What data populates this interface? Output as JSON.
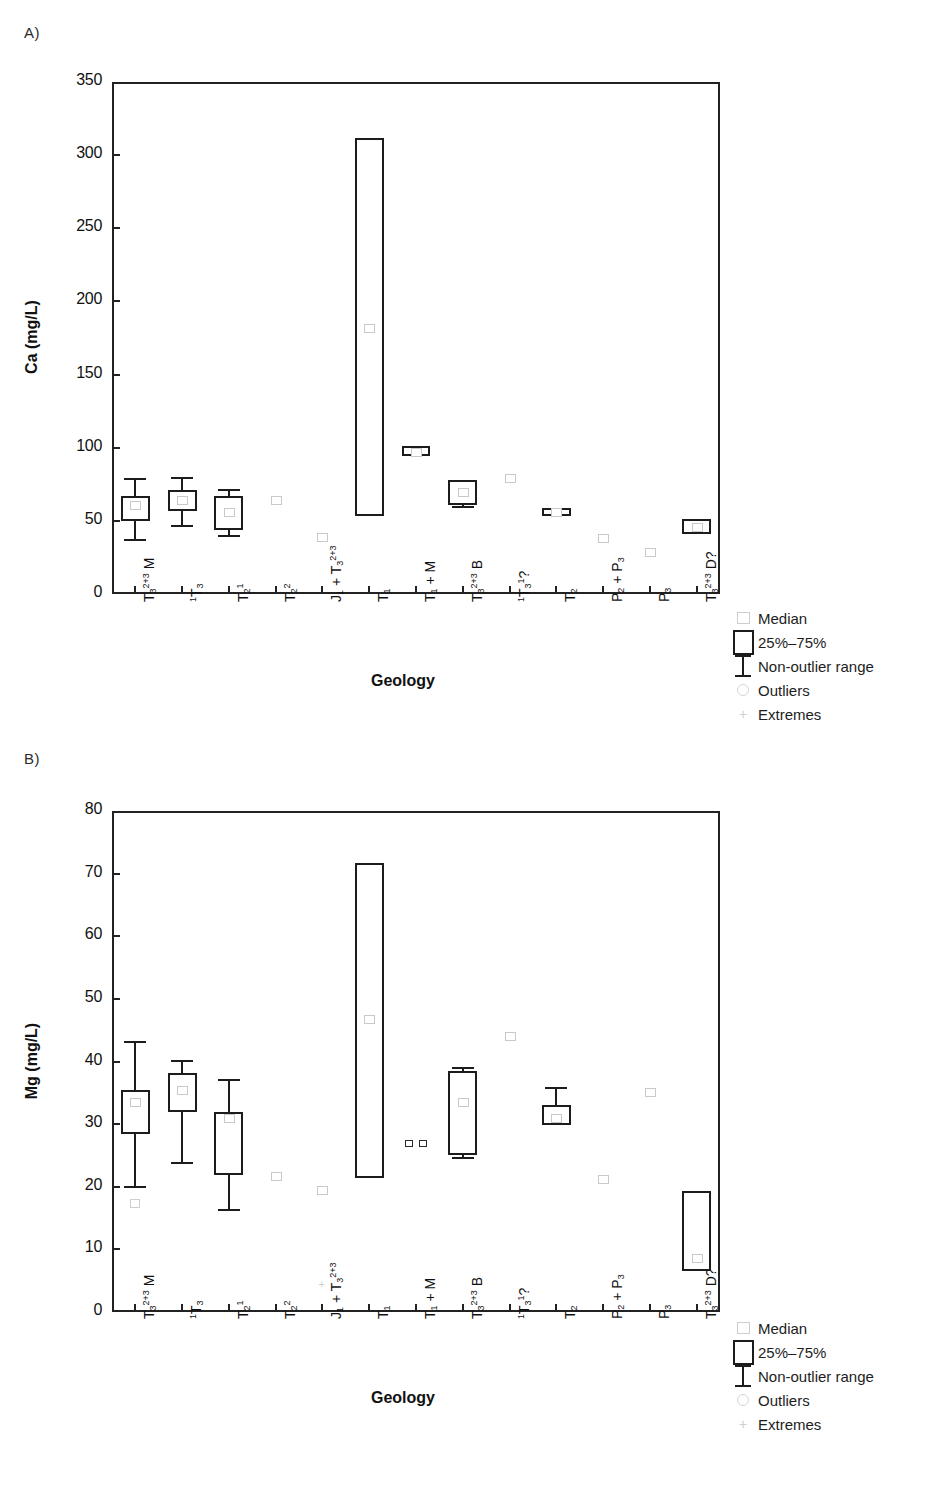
{
  "figure": {
    "panel_a_letter": "A)",
    "panel_b_letter": "B)"
  },
  "legend": {
    "items": [
      {
        "label": "Median",
        "symbol": "median-square-icon"
      },
      {
        "label": "25%–75%",
        "symbol": "box-icon"
      },
      {
        "label": "Non-outlier range",
        "symbol": "whisker-icon"
      },
      {
        "label": "Outliers",
        "symbol": "outlier-circle-icon"
      },
      {
        "label": "Extremes",
        "symbol": "extreme-cross-icon"
      }
    ]
  },
  "chart_data": [
    {
      "type": "box",
      "panel": "A",
      "title": "",
      "xlabel": "Geology",
      "ylabel": "Ca (mg/L)",
      "ylim": [
        0,
        350
      ],
      "yticks": [
        0,
        50,
        100,
        150,
        200,
        250,
        300,
        350
      ],
      "ytick_labels": [
        "0",
        "50",
        "100",
        "150",
        "200",
        "250",
        "300",
        "350"
      ],
      "grid": false,
      "categories": [
        {
          "html": "T<sub>3</sub><sup>2+3</sup> M",
          "plain": "T3^2+3 M"
        },
        {
          "html": "<span class=\"pre\">1</span>T<sub>3</sub>",
          "plain": "1T3"
        },
        {
          "html": "T<sub>2</sub><sup>1</sup>",
          "plain": "T2^1"
        },
        {
          "html": "T<sub>2</sub><sup>2</sup>",
          "plain": "T2^2"
        },
        {
          "html": "J<sub>1</sub> + T<sub>3</sub><sup>2+3</sup>",
          "plain": "J1 + T3^2+3"
        },
        {
          "html": "T<sub>1</sub>",
          "plain": "T1"
        },
        {
          "html": "T<sub>1</sub> + M",
          "plain": "T1 + M"
        },
        {
          "html": "T<sub>3</sub><sup>2+3</sup> B",
          "plain": "T3^2+3 B"
        },
        {
          "html": "<span class=\"pre\">1</span>T<sub>3</sub><sup>1</sup>?",
          "plain": "1T3^1 ?"
        },
        {
          "html": "T<sub>2</sub>",
          "plain": "T2"
        },
        {
          "html": "P<sub>2</sub> + P<sub>3</sub>",
          "plain": "P2 + P3"
        },
        {
          "html": "P<sub>3</sub>",
          "plain": "P3"
        },
        {
          "html": "T<sub>3</sub><sup>2+3</sup> D?",
          "plain": "T3^2+3 D?"
        }
      ],
      "boxes": [
        {
          "category": "T3^2+3 M",
          "q1": 50,
          "q3": 67,
          "median": 61,
          "whisker_low": 36,
          "whisker_high": 79,
          "has_box": true
        },
        {
          "category": "1T3",
          "q1": 57,
          "q3": 71,
          "median": 64,
          "whisker_low": 46,
          "whisker_high": 80,
          "has_box": true
        },
        {
          "category": "T2^1",
          "q1": 44,
          "q3": 67,
          "median": 56,
          "whisker_low": 39,
          "whisker_high": 72,
          "has_box": true
        },
        {
          "category": "T2^2",
          "median": 64,
          "has_box": false
        },
        {
          "category": "J1 + T3^2+3",
          "median": 39,
          "has_box": false
        },
        {
          "category": "T1",
          "q1": 53,
          "q3": 312,
          "median": 182,
          "has_box": true
        },
        {
          "category": "T1 + M",
          "q1": 94,
          "q3": 101,
          "median": 97,
          "has_box": true
        },
        {
          "category": "T3^2+3 B",
          "q1": 61,
          "q3": 78,
          "median": 70,
          "whisker_low": 59,
          "has_box": true
        },
        {
          "category": "1T3^1 ?",
          "median": 79,
          "has_box": false
        },
        {
          "category": "T2",
          "q1": 53,
          "q3": 59,
          "median": 56,
          "whisker_high": 59,
          "has_box": true
        },
        {
          "category": "P2 + P3",
          "median": 38,
          "has_box": false
        },
        {
          "category": "P3",
          "median": 29,
          "has_box": false
        },
        {
          "category": "T3^2+3 D?",
          "q1": 41,
          "q3": 51,
          "median": 46,
          "has_box": true
        }
      ]
    },
    {
      "type": "box",
      "panel": "B",
      "title": "",
      "xlabel": "Geology",
      "ylabel": "Mg (mg/L)",
      "ylim": [
        0,
        80
      ],
      "yticks": [
        0,
        10,
        20,
        30,
        40,
        50,
        60,
        70,
        80
      ],
      "ytick_labels": [
        "0",
        "10",
        "20",
        "30",
        "40",
        "50",
        "60",
        "70",
        "80"
      ],
      "grid": false,
      "categories": [
        {
          "html": "T<sub>3</sub><sup>2+3</sup> M",
          "plain": "T3^2+3 M"
        },
        {
          "html": "<span class=\"pre\">1</span>T<sub>3</sub>",
          "plain": "1T3"
        },
        {
          "html": "T<sub>2</sub><sup>1</sup>",
          "plain": "T2^1"
        },
        {
          "html": "T<sub>2</sub><sup>2</sup>",
          "plain": "T2^2"
        },
        {
          "html": "J<sub>1</sub> + T<sub>3</sub><sup>2+3</sup>",
          "plain": "J1 + T3^2+3"
        },
        {
          "html": "T<sub>1</sub>",
          "plain": "T1"
        },
        {
          "html": "T<sub>1</sub> + M",
          "plain": "T1 + M"
        },
        {
          "html": "T<sub>3</sub><sup>2+3</sup> B",
          "plain": "T3^2+3 B"
        },
        {
          "html": "<span class=\"pre\">1</span>T<sub>3</sub><sup>1</sup>?",
          "plain": "1T3^1 ?"
        },
        {
          "html": "T<sub>2</sub>",
          "plain": "T2"
        },
        {
          "html": "P<sub>2</sub> + P<sub>3</sub>",
          "plain": "P2 + P3"
        },
        {
          "html": "P<sub>3</sub>",
          "plain": "P3"
        },
        {
          "html": "T<sub>3</sub><sup>2+3</sup> D?",
          "plain": "T3^2+3 D?"
        }
      ],
      "boxes": [
        {
          "category": "T3^2+3 M",
          "q1": 28.5,
          "q3": 35.5,
          "median": 33.5,
          "whisker_low": 19.8,
          "whisker_high": 43.2,
          "has_box": true,
          "outlier": 17.4
        },
        {
          "category": "1T3",
          "q1": 32,
          "q3": 38.2,
          "median": 35.5,
          "whisker_low": 23.7,
          "whisker_high": 40.2,
          "has_box": true
        },
        {
          "category": "T2^1",
          "q1": 21.8,
          "q3": 32,
          "median": 31,
          "whisker_low": 16.1,
          "whisker_high": 37.2,
          "has_box": true
        },
        {
          "category": "T2^2",
          "median": 21.7,
          "has_box": false
        },
        {
          "category": "J1 + T3^2+3",
          "median": 19.5,
          "has_box": false,
          "extreme": 4.3
        },
        {
          "category": "T1",
          "q1": 21.4,
          "q3": 71.7,
          "median": 46.8,
          "has_box": true
        },
        {
          "category": "T1 + M",
          "median": 26.8,
          "has_box": false,
          "pair": true
        },
        {
          "category": "T3^2+3 B",
          "q1": 25,
          "q3": 38.5,
          "median": 33.5,
          "whisker_low": 24.5,
          "whisker_high": 39.1,
          "has_box": true
        },
        {
          "category": "1T3^1 ?",
          "median": 44,
          "has_box": false
        },
        {
          "category": "T2",
          "q1": 29.8,
          "q3": 33.1,
          "median": 31,
          "whisker_high": 36,
          "has_box": true
        },
        {
          "category": "P2 + P3",
          "median": 21.2,
          "has_box": false
        },
        {
          "category": "P3",
          "median": 35.2,
          "has_box": false
        },
        {
          "category": "T3^2+3 D?",
          "q1": 6.6,
          "q3": 19.3,
          "median": 8.6,
          "has_box": true
        }
      ]
    }
  ]
}
